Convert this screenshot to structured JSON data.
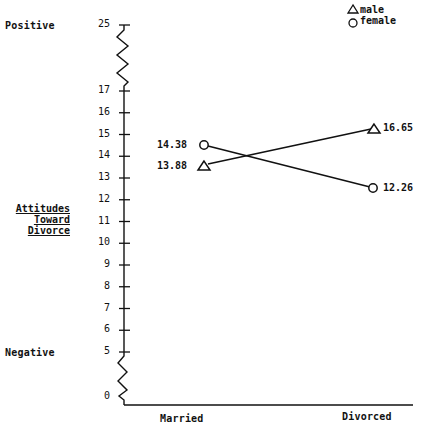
{
  "chart_data": {
    "type": "line",
    "title": "",
    "xlabel": "",
    "ylabel": "Attitudes Toward Divorce",
    "ylabel_lines": [
      "Attitudes",
      "Toward",
      "Divorce"
    ],
    "y_anchor_labels": {
      "top": "Positive",
      "bottom": "Negative"
    },
    "categories": [
      "Married",
      "Divorced"
    ],
    "series": [
      {
        "name": "male",
        "marker": "triangle",
        "values": [
          13.88,
          16.65
        ]
      },
      {
        "name": "female",
        "marker": "circle",
        "values": [
          14.38,
          12.26
        ]
      }
    ],
    "y_ticks": [
      0,
      5,
      6,
      7,
      8,
      9,
      10,
      11,
      12,
      13,
      14,
      15,
      16,
      17,
      25
    ],
    "y_axis_breaks": [
      "17-25",
      "0-5"
    ],
    "ylim": [
      0,
      25
    ],
    "grid": false,
    "legend_position": "top-right",
    "legend": [
      {
        "symbol": "△",
        "label": "male"
      },
      {
        "symbol": "○",
        "label": "female"
      }
    ],
    "data_labels": {
      "male_married": "13.88",
      "female_married": "14.38",
      "male_divorced": "16.65",
      "female_divorced": "12.26"
    }
  }
}
